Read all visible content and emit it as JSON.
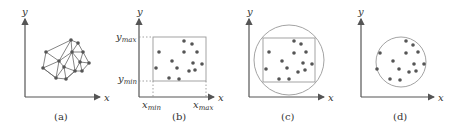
{
  "figure": {
    "panels": [
      {
        "id": "a",
        "caption": "(a)",
        "x_axis_label": "x",
        "y_axis_label": "y",
        "description": "Triangulated mesh of scattered points"
      },
      {
        "id": "b",
        "caption": "(b)",
        "x_axis_label": "x",
        "y_axis_label": "y",
        "y_max_label": "y",
        "y_max_sub": "max",
        "y_min_label": "y",
        "y_min_sub": "min",
        "x_min_label": "x",
        "x_min_sub": "min",
        "x_max_label": "x",
        "x_max_sub": "max",
        "description": "Axis-aligned bounding box of points"
      },
      {
        "id": "c",
        "caption": "(c)",
        "x_axis_label": "x",
        "y_axis_label": "y",
        "description": "Circle circumscribing the bounding box"
      },
      {
        "id": "d",
        "caption": "(d)",
        "x_axis_label": "x",
        "y_axis_label": "y",
        "description": "Minimal enclosing circle of points"
      }
    ]
  }
}
